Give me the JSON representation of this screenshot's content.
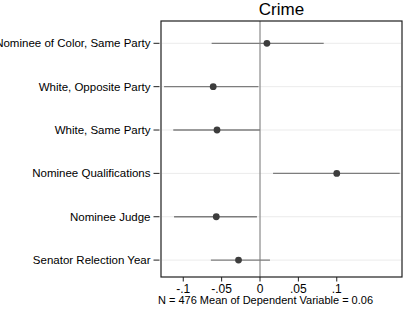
{
  "colors": {
    "background": "#ffffff",
    "border": "#1f1f1f",
    "gridline": "#ebebeb",
    "zero_line": "#8a8a8a",
    "whisker": "#7d7d7d",
    "dot": "#3d3d3d",
    "text": "#000000"
  },
  "chart_data": {
    "type": "scatter",
    "subtype": "coefficient-dot-whisker-plot",
    "title": "Crime",
    "note": "N = 476 Mean of Dependent Variable = 0.06",
    "xlabel": "",
    "ylabel": "",
    "xlim": [
      -0.129,
      0.185
    ],
    "grid": true,
    "legend": "none",
    "zero_reference_line": 0,
    "x_ticks": [
      {
        "value": -0.1,
        "label": "-.1"
      },
      {
        "value": -0.05,
        "label": "-.05"
      },
      {
        "value": 0,
        "label": "0"
      },
      {
        "value": 0.05,
        "label": ".05"
      },
      {
        "value": 0.1,
        "label": ".1"
      }
    ],
    "categories": [
      "Nominee of Color, Same Party",
      "White, Opposite Party",
      "White, Same Party",
      "Nominee Qualifications",
      "Nominee Judge",
      "Senator Relection Year"
    ],
    "points": [
      {
        "label": "Nominee of Color, Same Party",
        "estimate": 0.009,
        "ci_low": -0.063,
        "ci_high": 0.083
      },
      {
        "label": "White, Opposite Party",
        "estimate": -0.061,
        "ci_low": -0.125,
        "ci_high": -0.002
      },
      {
        "label": "White, Same Party",
        "estimate": -0.056,
        "ci_low": -0.113,
        "ci_high": 0.0
      },
      {
        "label": "Nominee Qualifications",
        "estimate": 0.1,
        "ci_low": 0.017,
        "ci_high": 0.182
      },
      {
        "label": "Nominee Judge",
        "estimate": -0.057,
        "ci_low": -0.112,
        "ci_high": -0.004
      },
      {
        "label": "Senator Relection Year",
        "estimate": -0.028,
        "ci_low": -0.064,
        "ci_high": 0.013
      }
    ]
  }
}
